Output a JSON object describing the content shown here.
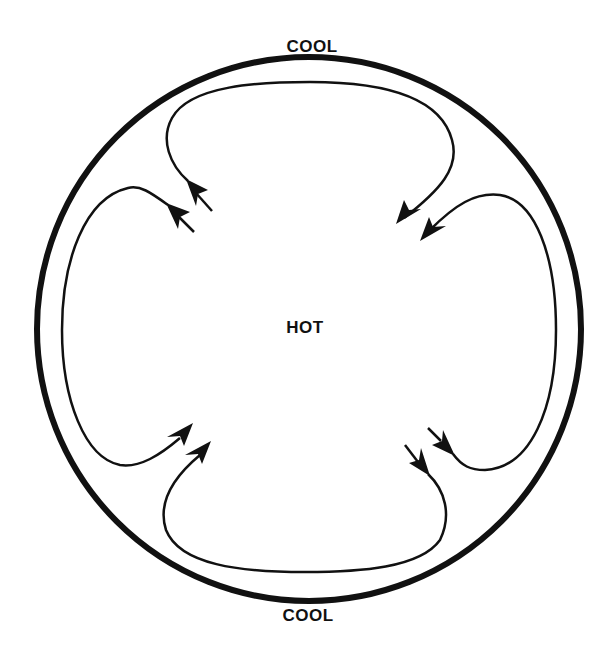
{
  "diagram": {
    "title": "",
    "labels": {
      "top": "COOL",
      "center": "HOT",
      "bottom": "COOL"
    },
    "colors": {
      "stroke": "#111111",
      "background": "#ffffff"
    },
    "outer_boundary": {
      "shape": "circle",
      "cx": 309,
      "cy": 329,
      "r": 272,
      "stroke_width": 6
    },
    "flow_loops": [
      {
        "id": "top-loop",
        "start_near": "center-upper-left",
        "path_around": "top",
        "end_near": "center-upper-right"
      },
      {
        "id": "left-loop",
        "start_near": "center-upper-left",
        "path_around": "left",
        "end_near": "center-lower-left"
      },
      {
        "id": "bottom-loop",
        "start_near": "center-lower-right",
        "path_around": "bottom",
        "end_near": "center-lower-left"
      },
      {
        "id": "right-loop",
        "start_near": "center-lower-right",
        "path_around": "right",
        "end_near": "center-upper-right"
      }
    ]
  }
}
